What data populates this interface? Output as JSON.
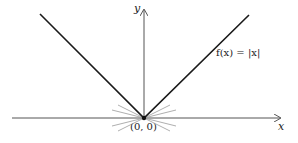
{
  "figure": {
    "function_label": "f(x) = |x|",
    "x_axis_label": "x",
    "y_axis_label": "y",
    "origin_label": "(0, 0)",
    "colors": {
      "graph": "#1a1a1a",
      "axes": "#555555",
      "tangent_lines": "#9a9a9a",
      "background": "#ffffff"
    }
  }
}
